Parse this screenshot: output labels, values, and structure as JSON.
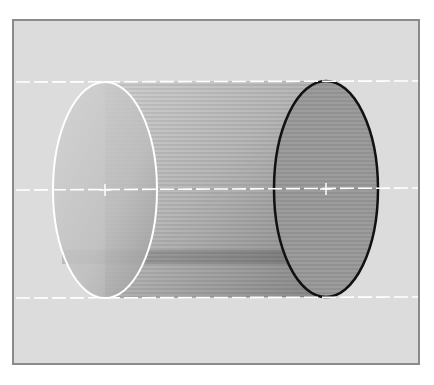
{
  "diagram": {
    "type": "cylinder-illustration",
    "colors": {
      "background": "#dcdcdc",
      "frame_border": "#8a8a8a",
      "body_light": "#c8c8c8",
      "body_dark": "#8e8e8e",
      "front_face_fill": "#9a9a9a",
      "front_face_outline": "#111111",
      "back_face_outline": "#ffffff",
      "guide_lines": "#ffffff"
    },
    "left_ellipse": {
      "cx": 105,
      "cy": 190,
      "rx": 52,
      "ry": 108,
      "outline": "white"
    },
    "right_ellipse": {
      "cx": 326,
      "cy": 189,
      "rx": 52,
      "ry": 108,
      "outline": "black"
    },
    "guide_lines_y": [
      82,
      189,
      298
    ]
  }
}
